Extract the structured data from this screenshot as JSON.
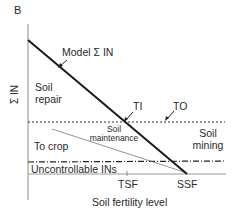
{
  "panel_label": "B",
  "y_axis_label": "Σ IN",
  "x_axis_label": "Soil fertility level",
  "lines": {
    "model_line_label": "Model Σ IN",
    "ti_label": "TI",
    "to_label": "TO"
  },
  "regions": {
    "soil_repair": [
      "Soil",
      "repair"
    ],
    "soil_maintenance": [
      "Soil",
      "maintenance"
    ],
    "soil_mining": [
      "Soil",
      "mining"
    ],
    "to_crop": "To crop",
    "uncontrollable": "Uncontrollable INs"
  },
  "x_ticks": {
    "tsf": "TSF",
    "ssf": "SSF"
  },
  "colors": {
    "line": "#1a1a1a",
    "thin_line": "#777777",
    "text": "#2a2a2a"
  }
}
